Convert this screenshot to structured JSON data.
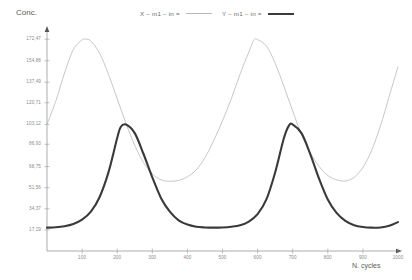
{
  "chart_data": {
    "type": "line",
    "title": "",
    "xlabel": "N. cycles",
    "ylabel": "Conc.",
    "xlim": [
      0,
      1000
    ],
    "ylim": [
      0,
      180
    ],
    "grid": false,
    "legend_position": "top",
    "x_ticks": [
      100,
      200,
      300,
      400,
      500,
      600,
      700,
      800,
      900,
      1000
    ],
    "x_tick_labels": [
      "100",
      "200",
      "300",
      "400",
      "500",
      "600",
      "700",
      "800",
      "900",
      "1000"
    ],
    "y_ticks": [
      17.19,
      34.37,
      51.56,
      68.75,
      86.93,
      103.12,
      120.71,
      137.49,
      154.88,
      172.47
    ],
    "y_tick_labels": [
      "17,19",
      "34,37",
      "51,56",
      "68,75",
      "86,93",
      "103,12",
      "120,71",
      "137,49",
      "154,88",
      "172,47"
    ],
    "series": [
      {
        "name": "X – m1 – in =",
        "color": "#b9b9b9",
        "width": 0.8,
        "x": [
          0,
          25,
          50,
          75,
          100,
          110,
          125,
          150,
          175,
          200,
          225,
          250,
          275,
          300,
          325,
          350,
          375,
          400,
          425,
          450,
          475,
          500,
          525,
          550,
          575,
          590,
          600,
          625,
          650,
          675,
          700,
          725,
          750,
          775,
          800,
          825,
          850,
          875,
          900,
          925,
          950,
          975,
          1000
        ],
        "values": [
          103.1,
          122.0,
          145.0,
          164.0,
          172.0,
          172.5,
          171.0,
          161.0,
          144.0,
          124.0,
          104.0,
          86.0,
          72.0,
          63.0,
          58.0,
          56.8,
          57.5,
          60.5,
          66.0,
          76.0,
          90.0,
          106.0,
          124.0,
          144.0,
          162.0,
          172.0,
          172.2,
          167.0,
          153.0,
          134.0,
          114.0,
          95.0,
          80.0,
          69.0,
          61.5,
          58.0,
          57.0,
          60.0,
          68.0,
          82.0,
          102.0,
          126.0,
          150.0
        ]
      },
      {
        "name": "Y – m1 – in =",
        "color": "#3a3a3a",
        "width": 2.1,
        "x": [
          0,
          25,
          50,
          75,
          100,
          125,
          150,
          175,
          200,
          210,
          225,
          250,
          275,
          300,
          325,
          350,
          375,
          400,
          425,
          450,
          475,
          500,
          525,
          550,
          575,
          600,
          625,
          650,
          675,
          690,
          700,
          725,
          750,
          775,
          800,
          825,
          850,
          875,
          900,
          925,
          950,
          975,
          1000
        ],
        "values": [
          19.0,
          19.3,
          20.2,
          22.0,
          25.5,
          32.0,
          44.0,
          64.0,
          92.0,
          101.0,
          103.0,
          96.0,
          79.0,
          60.0,
          43.0,
          32.0,
          25.0,
          21.5,
          19.8,
          19.2,
          19.0,
          19.2,
          19.8,
          21.0,
          24.0,
          30.0,
          42.0,
          64.0,
          92.0,
          102.5,
          103.0,
          96.0,
          79.0,
          59.0,
          42.0,
          31.0,
          24.5,
          21.0,
          19.5,
          19.0,
          19.2,
          20.5,
          23.5
        ]
      }
    ]
  },
  "legend": {
    "entries": [
      {
        "label": "X – m1 – in ="
      },
      {
        "label": "Y – m1 – in ="
      }
    ]
  },
  "axes": {
    "y_title": "Conc.",
    "x_title": "N. cycles"
  }
}
